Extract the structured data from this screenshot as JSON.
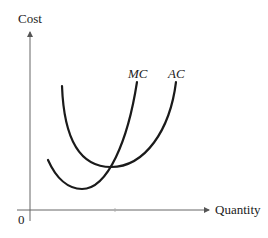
{
  "diagram": {
    "y_axis_label": "Cost",
    "x_axis_label": "Quantity",
    "origin_label": "0",
    "curves": [
      {
        "name": "MC",
        "label": "MC",
        "shape": "U-shaped, steeper, minimum at lower quantity, crosses AC at AC's minimum"
      },
      {
        "name": "AC",
        "label": "AC",
        "shape": "U-shaped, shallower, minimum where MC crosses it"
      }
    ],
    "colors": {
      "curve": "#1a1a1a",
      "axis": "#555555",
      "text": "#222222"
    }
  }
}
